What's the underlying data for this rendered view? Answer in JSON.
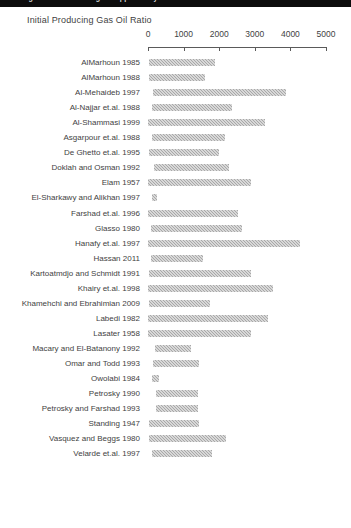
{
  "window": {
    "top_sliver_text": "Building Gas Oil Ratio Range of Applicability for Black Oil Correlations"
  },
  "chart": {
    "title": "Initial Producing Gas Oil Ratio"
  },
  "chart_data": {
    "type": "bar",
    "orientation": "horizontal",
    "subtype": "range-bar",
    "title": "Initial Producing Gas Oil Ratio",
    "xlabel": "",
    "ylabel": "",
    "xlim": [
      0,
      5000
    ],
    "xticks": [
      0,
      1000,
      2000,
      3000,
      4000,
      5000
    ],
    "xtick_labels": [
      "0",
      "1000",
      "2000",
      "3000",
      "4000",
      "5000"
    ],
    "grid": false,
    "legend": false,
    "bar_color": "#a8a8a8",
    "categories": [
      "AlMarhoun 1985",
      "AlMarhoun 1988",
      "Al-Mehaideb 1997",
      "Al-Najjar et.al. 1988",
      "Al-Shammasi 1999",
      "Asgarpour et.al. 1988",
      "De Ghetto et.al. 1995",
      "Doklah and Osman 1992",
      "Elam 1957",
      "El-Sharkawy and Alikhan 1997",
      "Farshad et.al. 1996",
      "Glasso 1980",
      "Hanafy et.al. 1997",
      "Hassan 2011",
      "Kartoatmdjo and Schmidt 1991",
      "Khairy et.al. 1998",
      "Khamehchi and Ebrahimian 2009",
      "Labedi 1982",
      "Lasater 1958",
      "Macary and El-Batanony 1992",
      "Omar and Todd 1993",
      "Owolabi 1984",
      "Petrosky 1990",
      "Petrosky and Farshad 1993",
      "Standing 1947",
      "Vasquez and Beggs 1980",
      "Velarde et.al. 1997"
    ],
    "ranges": [
      {
        "label": "AlMarhoun 1985",
        "low": 26,
        "high": 1890
      },
      {
        "label": "AlMarhoun 1988",
        "low": 26,
        "high": 1602
      },
      {
        "label": "Al-Mehaideb 1997",
        "low": 128,
        "high": 3871
      },
      {
        "label": "Al-Najjar et.al. 1988",
        "low": 100,
        "high": 2360
      },
      {
        "label": "Al-Shammasi 1999",
        "low": 6,
        "high": 3298
      },
      {
        "label": "Asgarpour et.al. 1988",
        "low": 110,
        "high": 2160
      },
      {
        "label": "De Ghetto et.al. 1995",
        "low": 17,
        "high": 1987
      },
      {
        "label": "Doklah and Osman 1992",
        "low": 181,
        "high": 2266
      },
      {
        "label": "Elam 1957",
        "low": 6,
        "high": 2906
      },
      {
        "label": "El-Sharkawy and Alikhan 1997",
        "low": 100,
        "high": 260
      },
      {
        "label": "Farshad et.al. 1996",
        "low": 6,
        "high": 2538
      },
      {
        "label": "Glasso 1980",
        "low": 90,
        "high": 2637
      },
      {
        "label": "Hanafy et.al. 1997",
        "low": 7,
        "high": 4272
      },
      {
        "label": "Hassan 2011",
        "low": 85,
        "high": 1545
      },
      {
        "label": "Kartoatmdjo and Schmidt 1991",
        "low": 15,
        "high": 2890
      },
      {
        "label": "Khairy et.al. 1998",
        "low": 7,
        "high": 3502
      },
      {
        "label": "Khamehchi and Ebrahimian 2009",
        "low": 19,
        "high": 1742
      },
      {
        "label": "Labedi 1982",
        "low": 13,
        "high": 3370
      },
      {
        "label": "Lasater 1958",
        "low": 3,
        "high": 2905
      },
      {
        "label": "Macary and El-Batanony 1992",
        "low": 200,
        "high": 1200
      },
      {
        "label": "Omar and Todd 1993",
        "low": 142,
        "high": 1440
      },
      {
        "label": "Owolabi 1984",
        "low": 100,
        "high": 300
      },
      {
        "label": "Petrosky 1990",
        "low": 217,
        "high": 1406
      },
      {
        "label": "Petrosky and Farshad 1993",
        "low": 217,
        "high": 1406
      },
      {
        "label": "Standing 1947",
        "low": 20,
        "high": 1425
      },
      {
        "label": "Vasquez and Beggs 1980",
        "low": 20,
        "high": 2199
      },
      {
        "label": "Velarde et.al. 1997",
        "low": 102,
        "high": 1808
      }
    ]
  }
}
